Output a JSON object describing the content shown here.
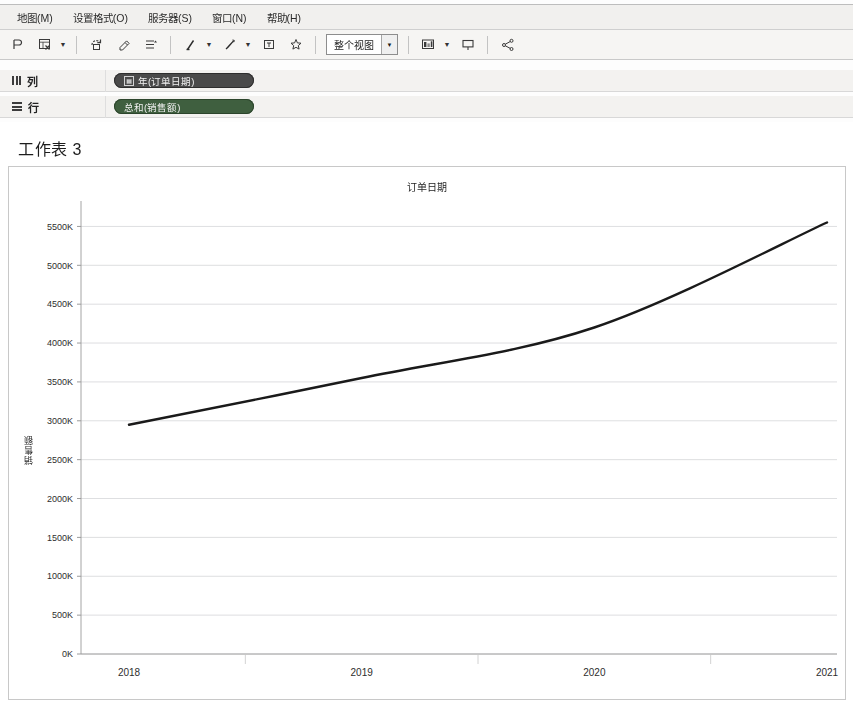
{
  "app": {
    "menu": [
      {
        "label": "地图(M)",
        "name": "menu-map"
      },
      {
        "label": "设置格式(O)",
        "name": "menu-format"
      },
      {
        "label": "服务器(S)",
        "name": "menu-server"
      },
      {
        "label": "窗口(N)",
        "name": "menu-window"
      },
      {
        "label": "帮助(H)",
        "name": "menu-help"
      }
    ]
  },
  "toolbar": {
    "fit_selected": "整个视图",
    "icons": [
      "presentation-undo-icon",
      "new-worksheet-icon",
      "duplicate-icon",
      "clear-sheet-icon",
      "swap-rows-columns-icon",
      "sort-ascending-icon",
      "sort-descending-icon",
      "highlight-icon",
      "group-members-icon",
      "show-mark-labels-icon",
      "fix-axes-icon",
      "show-hide-cards-icon",
      "presentation-mode-icon",
      "share-icon"
    ]
  },
  "shelves": {
    "columns": {
      "label": "列",
      "pills": [
        {
          "text": "年(订单日期)",
          "type": "discrete",
          "glyph": "▦"
        }
      ]
    },
    "rows": {
      "label": "行",
      "pills": [
        {
          "text": "总和(销售额)",
          "type": "continuous",
          "glyph": ""
        }
      ]
    }
  },
  "sheet": {
    "title": "工作表 3"
  },
  "chart_data": {
    "type": "line",
    "title": "订单日期",
    "xlabel": "",
    "ylabel": "销售额",
    "categories": [
      "2018",
      "2019",
      "2020",
      "2021"
    ],
    "x": [
      2018,
      2019,
      2020,
      2021
    ],
    "values": [
      2950000,
      3550000,
      4200000,
      5550000
    ],
    "value_labels": [
      "2950K",
      "3550K",
      "4200K",
      "5550K"
    ],
    "series": [
      {
        "name": "总和(销售额)",
        "values": [
          2950000,
          3550000,
          4200000,
          5550000
        ]
      }
    ],
    "ylim": [
      0,
      5750000
    ],
    "ytick_values": [
      0,
      500000,
      1000000,
      1500000,
      2000000,
      2500000,
      3000000,
      3500000,
      4000000,
      4500000,
      5000000,
      5500000
    ],
    "ytick_labels": [
      "0K",
      "500K",
      "1000K",
      "1500K",
      "2000K",
      "2500K",
      "3000K",
      "3500K",
      "4000K",
      "4500K",
      "5000K",
      "5500K"
    ],
    "xtick_labels": [
      "2018",
      "2019",
      "2020",
      "2021"
    ],
    "grid": true,
    "legend": "none",
    "line_color": "#1a1a1a"
  }
}
